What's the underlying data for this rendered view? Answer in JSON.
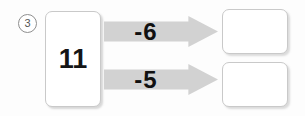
{
  "problem": {
    "number_label": "3",
    "start_value": "11",
    "operations": [
      {
        "label": "-6",
        "arrow_icon": "right-arrow-icon",
        "answer_value": ""
      },
      {
        "label": "-5",
        "arrow_icon": "right-arrow-icon",
        "answer_value": ""
      }
    ]
  },
  "colors": {
    "arrow_fill": "#d2d2d2",
    "box_border": "#c9c9c9",
    "text": "#111111",
    "background": "#fdfdfd"
  }
}
